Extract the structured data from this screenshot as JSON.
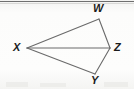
{
  "figure": {
    "kind": "geometry-diagram",
    "background_color": "#fbfbfa",
    "stroke_color": "#6a6a6a",
    "label_color": "#1c1c1c",
    "stroke_width": 1,
    "canvas": {
      "width": 134,
      "height": 89
    },
    "top_rule": {
      "visible": true,
      "color": "#6f6f6f",
      "y": 1
    },
    "vertices": [
      {
        "id": "W",
        "label": "W",
        "x": 99,
        "y": 19,
        "label_x": 93,
        "label_y": 3
      },
      {
        "id": "Z",
        "label": "Z",
        "x": 110,
        "y": 48,
        "label_x": 114,
        "label_y": 42
      },
      {
        "id": "Y",
        "label": "Y",
        "x": 95,
        "y": 74,
        "label_x": 91,
        "label_y": 75
      },
      {
        "id": "X",
        "label": "X",
        "x": 27,
        "y": 48,
        "label_x": 13,
        "label_y": 42
      }
    ],
    "edges": [
      {
        "from": "X",
        "to": "W",
        "name": "segment-xw"
      },
      {
        "from": "W",
        "to": "Z",
        "name": "segment-wz"
      },
      {
        "from": "Z",
        "to": "Y",
        "name": "segment-zy"
      },
      {
        "from": "Y",
        "to": "X",
        "name": "segment-yx"
      }
    ],
    "diagonals": [
      {
        "from": "X",
        "to": "Z",
        "name": "segment-xz"
      }
    ]
  }
}
